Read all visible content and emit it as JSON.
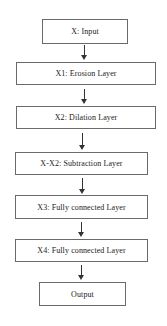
{
  "diagram": {
    "type": "flowchart",
    "direction": "top-to-bottom",
    "nodes": [
      {
        "id": "input",
        "label": "X: Input"
      },
      {
        "id": "erosion",
        "label": "X1: Erosion Layer"
      },
      {
        "id": "dilation",
        "label": "X2: Dilation Layer"
      },
      {
        "id": "subtraction",
        "label": "X-X2: Subtraction Layer"
      },
      {
        "id": "fc1",
        "label": "X3: Fully connected Layer"
      },
      {
        "id": "fc2",
        "label": "X4: Fully connected Layer"
      },
      {
        "id": "output",
        "label": "Output"
      }
    ],
    "edges": [
      {
        "from": "input",
        "to": "erosion"
      },
      {
        "from": "erosion",
        "to": "dilation"
      },
      {
        "from": "dilation",
        "to": "subtraction"
      },
      {
        "from": "subtraction",
        "to": "fc1"
      },
      {
        "from": "fc1",
        "to": "fc2"
      },
      {
        "from": "fc2",
        "to": "output"
      }
    ]
  },
  "colors": {
    "border": "#6a6a6a",
    "arrow": "#333333",
    "text": "#222222",
    "background": "#ffffff"
  }
}
